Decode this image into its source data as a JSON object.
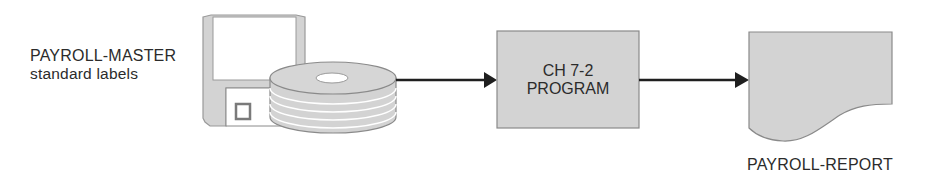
{
  "diagram": {
    "type": "system-flowchart",
    "input": {
      "name": "PAYROLL-MASTER",
      "subtitle": "standard labels",
      "icon": "floppy-disk-and-disk-pack-icon"
    },
    "process": {
      "line1": "CH 7-2",
      "line2": "PROGRAM",
      "shape": "rectangle"
    },
    "output": {
      "name": "PAYROLL-REPORT",
      "shape": "document"
    },
    "colors": {
      "fill": "#d3d3d3",
      "stroke": "#8a8a8a",
      "arrow": "#1f1f1f",
      "text": "#2b2b2b"
    }
  }
}
